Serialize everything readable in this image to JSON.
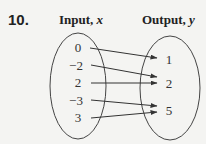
{
  "problem": {
    "number": "10."
  },
  "headers": {
    "input_label": "Input, ",
    "input_var": "x",
    "output_label": "Output, ",
    "output_var": "y"
  },
  "domain": {
    "values": [
      "0",
      "−2",
      "2",
      "−3",
      "3"
    ]
  },
  "range": {
    "values": [
      "1",
      "2",
      "5"
    ]
  },
  "mapping": [
    {
      "from": "0",
      "to": "1"
    },
    {
      "from": "−2",
      "to": "2"
    },
    {
      "from": "2",
      "to": "2"
    },
    {
      "from": "−3",
      "to": "5"
    },
    {
      "from": "3",
      "to": "5"
    }
  ],
  "colors": {
    "background": "#f4f4f2",
    "ink": "#333333"
  }
}
